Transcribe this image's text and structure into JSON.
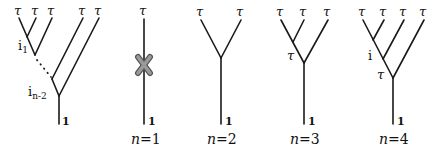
{
  "diagram": {
    "general_tree": {
      "leaf_labels": [
        "τ",
        "τ",
        "τ",
        "τ",
        "τ"
      ],
      "internal_labels": {
        "first": "i",
        "first_sub": "1",
        "last": "i",
        "last_sub": "n-2"
      },
      "root_label": "1",
      "ellipsis": "..."
    },
    "trees": [
      {
        "caption_var": "n",
        "caption_eq": "=1",
        "leaf_labels": [
          "τ"
        ],
        "root_label": "1",
        "forbidden_mark": "X"
      },
      {
        "caption_var": "n",
        "caption_eq": "=2",
        "leaf_labels": [
          "τ",
          "τ"
        ],
        "root_label": "1"
      },
      {
        "caption_var": "n",
        "caption_eq": "=3",
        "leaf_labels": [
          "τ",
          "τ",
          "τ"
        ],
        "internal_labels": [
          "τ"
        ],
        "root_label": "1"
      },
      {
        "caption_var": "n",
        "caption_eq": "=4",
        "leaf_labels": [
          "τ",
          "τ",
          "τ",
          "τ"
        ],
        "internal_labels": [
          "i",
          "τ"
        ],
        "root_label": "1"
      }
    ]
  },
  "colors": {
    "line": "#1a1a1a",
    "forbidden_mark_fill": "#9a9a9a",
    "forbidden_mark_outline": "#555555",
    "background": "#ffffff"
  }
}
